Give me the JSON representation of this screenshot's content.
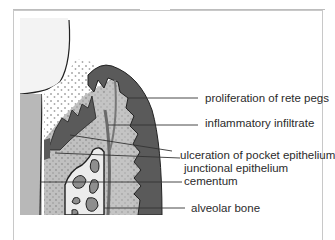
{
  "diagram": {
    "labels": [
      {
        "id": "rete-pegs",
        "text": "proliferation of rete pegs"
      },
      {
        "id": "inflammatory",
        "text": "inflammatory infiltrate"
      },
      {
        "id": "ulceration",
        "text": "ulceration of pocket epithelium"
      },
      {
        "id": "junctional",
        "text": "junctional epithelium"
      },
      {
        "id": "cementum",
        "text": "cementum"
      },
      {
        "id": "alveolar",
        "text": "alveolar bone"
      }
    ],
    "colors": {
      "enamel": "#f2f2f2",
      "dentin": "#b9b9b9",
      "oral_epithelium": "#555555",
      "connective_tissue": "#bdbdbd",
      "plaque_dots": "#9a9a9a",
      "bone": "#ececec",
      "marrow": "#8e8e8e",
      "leader_line": "#333333"
    }
  }
}
